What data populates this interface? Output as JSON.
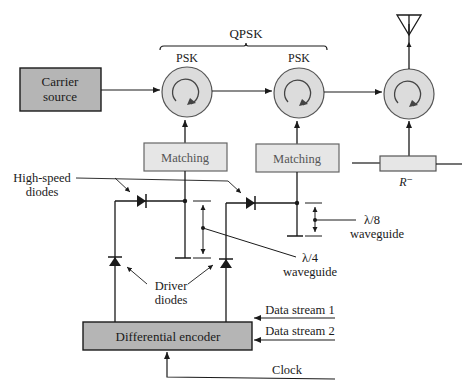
{
  "diagram": {
    "type": "block-diagram",
    "colors": {
      "block_dark_fill": "#b5b5b5",
      "block_light_fill": "#e6e6e6",
      "circulator_fill": "#dcdcdc",
      "line": "#1a1a1a",
      "light_text": "#555555"
    },
    "blocks": {
      "carrier_source": {
        "line1": "Carrier",
        "line2": "source"
      },
      "matching_1": {
        "label": "Matching"
      },
      "matching_2": {
        "label": "Matching"
      },
      "differential_encoder": {
        "label": "Differential encoder"
      },
      "resistor": {
        "label": "R⁻"
      }
    },
    "circulators": [
      {
        "label": "PSK"
      },
      {
        "label": "PSK"
      },
      {
        "label": ""
      }
    ],
    "brace": {
      "label": "QPSK"
    },
    "labels": {
      "high_speed_line1": "High-speed",
      "high_speed_line2": "diodes",
      "driver_line1": "Driver",
      "driver_line2": "diodes",
      "quarter_wave_line1": "λ/4",
      "quarter_wave_line2": "waveguide",
      "eighth_wave_line1": "λ/8",
      "eighth_wave_line2": "waveguide"
    },
    "inputs": [
      {
        "label": "Data stream 1"
      },
      {
        "label": "Data stream 2"
      },
      {
        "label": "Clock"
      }
    ],
    "icons": {
      "antenna": "antenna-icon",
      "circulator": "circulator-icon",
      "diode": "diode-icon"
    }
  }
}
